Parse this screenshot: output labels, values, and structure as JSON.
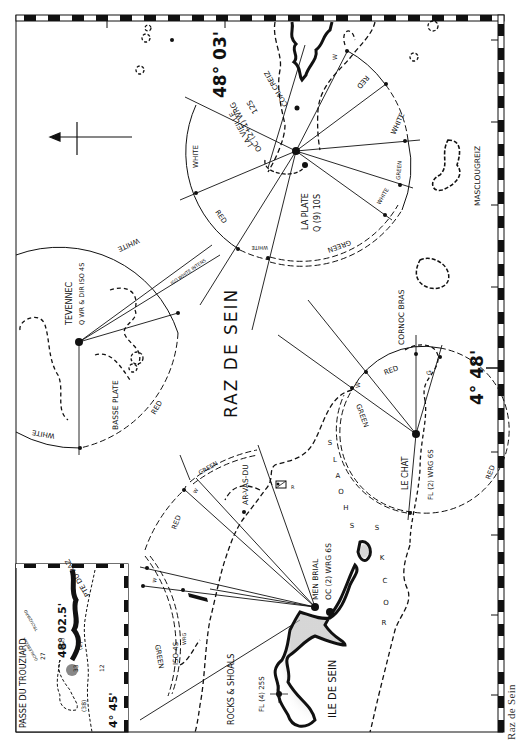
{
  "caption": "Raz de Sein",
  "title": "RAZ DE SEIN",
  "coordinates": {
    "lat_top": "48° 03'",
    "lon_right": "4° 48'",
    "inset_lat": "48° 02.5'",
    "inset_lon": "4° 45'"
  },
  "lights": {
    "la_vieille": {
      "name": "LA VIEILLE",
      "char": "OC (2+1) WRG",
      "period": "12S"
    },
    "la_plate": {
      "name": "LA PLATE",
      "char": "Q (9) 10S"
    },
    "tevennec": {
      "name": "TEVENNEC",
      "char": "Q WR & DIR ISO 4S"
    },
    "men_brial": {
      "name": "MEN BRIAL",
      "char": "OC (2) WRG 6S"
    },
    "le_chat": {
      "name": "LE CHAT",
      "char": "FL (2) WRG 6S"
    },
    "ile_de_sein": {
      "char": "FL (4) 25S"
    },
    "iso_light": {
      "char": "ISO 4S",
      "sub": "WRG"
    }
  },
  "places": {
    "coalcreiz": "COALCREIZ",
    "masclougreiz": "MASCLOUGREIZ",
    "basse_plate": "BASSE PLATE",
    "cornoc_bras": "CORNOC BRAS",
    "ar_vas_du": "AR-VAS-DU",
    "ile_de_sein": "ILE DE SEIN",
    "rocks_shoals": "ROCKS & SHOALS",
    "shoals": "SHOALS",
    "rocks": "ROCKS",
    "inset_title": "PASSE DU TROUZIARD",
    "pte_du_raz": "PTE DU RAZ",
    "trouziard": "TROUZIARD",
    "gorlebella": "GORLEBELLA"
  },
  "sectors": {
    "white": "WHITE",
    "red": "RED",
    "green": "GREEN",
    "w": "W",
    "g": "G",
    "white_intense": "ISO WHITE INTENS"
  },
  "inset_depths": [
    "27",
    "12",
    "33",
    "(82)",
    "(2)",
    "(38)"
  ],
  "rock_symbol": "R",
  "colors": {
    "ink": "#111111",
    "paper": "#ffffff",
    "caption": "#333333"
  }
}
